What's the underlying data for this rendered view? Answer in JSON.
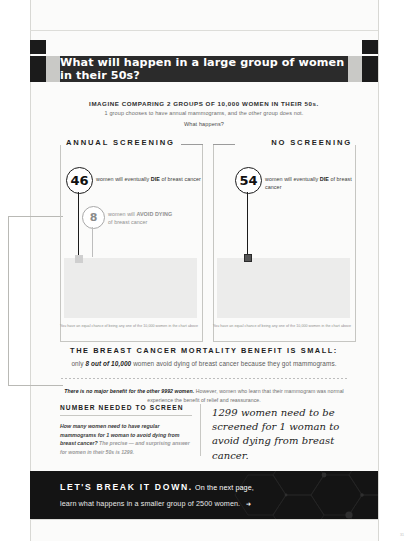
{
  "header": {
    "banner_title": "What will happen in a large group of women in their 50s?"
  },
  "intro": {
    "line1": "IMAGINE COMPARING 2 GROUPS OF 10,000 WOMEN IN THEIR 50s.",
    "line2": "1 group chooses to have annual mammograms, and the other group does not.",
    "line3": "What happens?"
  },
  "panels": [
    {
      "caption": "ANNUAL SCREENING",
      "die_count": "46",
      "die_label_pre": "women will eventually ",
      "die_label_bold": "DIE",
      "die_label_post": " of breast cancer",
      "avoid_count": "8",
      "avoid_label_line1_pre": "women will ",
      "avoid_label_line1_bold": "AVOID DYING",
      "avoid_label_line2": "of breast cancer",
      "footnote": "You have an equal chance of being any one of the 10,000 women in the chart above"
    },
    {
      "caption": "NO SCREENING",
      "die_count": "54",
      "die_label_pre": "women will eventually ",
      "die_label_bold": "DIE",
      "die_label_post": " of breast cancer",
      "footnote": "You have an equal chance of being any one of the 10,000 women in the chart above"
    }
  ],
  "mid": {
    "heading": "THE BREAST CANCER MORTALITY BENEFIT IS SMALL:",
    "sub_pre": "only ",
    "sub_bold": "8 out of 10,000",
    "sub_post": " women avoid dying of breast cancer because they got mammograms.",
    "note_bold": "There is no major benefit for the other 9992 women.",
    "note_rest": " However, women who learn that their mammogram was normal experience the benefit of relief and reassurance."
  },
  "nns": {
    "heading": "NUMBER NEEDED TO SCREEN",
    "question": "How many women need to have regular mammograms for 1 woman to avoid dying from breast cancer?",
    "answer": " The precise — and surprising answer for women in their 50s is 1299.",
    "callout": "1299 women need to be screened for 1 woman to avoid dying from breast cancer."
  },
  "footer": {
    "lead": "LET'S BREAK IT DOWN.",
    "lead_rest": " On the next page,",
    "line2": "learn what happens in a smaller group of 2500 women.",
    "arrow": "➜",
    "page_number": "31"
  },
  "colors": {
    "banner_bg": "#2b2b2b",
    "footer_bg": "#141414",
    "ink": "#1b1b1b",
    "muted": "#8f8f8f",
    "dot_field": "#ececeb"
  }
}
